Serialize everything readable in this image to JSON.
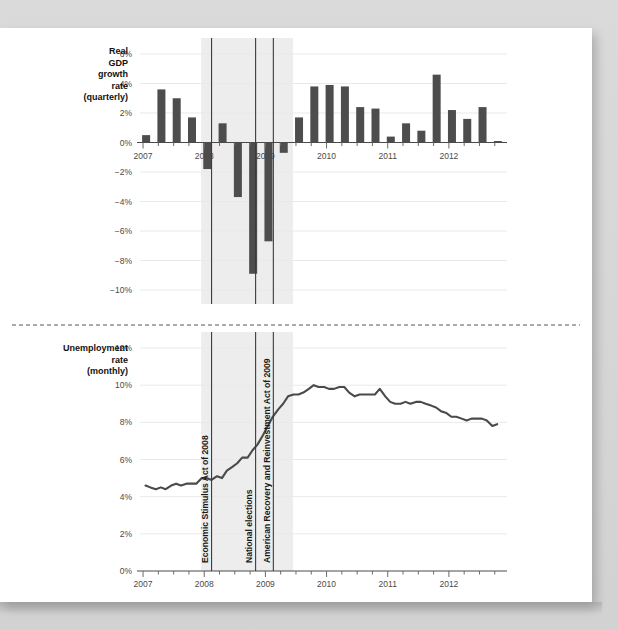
{
  "figure": {
    "background_color": "#d6d6d6",
    "paper_color": "#ffffff",
    "series_color": "#4d4d4d",
    "band_color": "#ededed"
  },
  "panels": {
    "gdp": {
      "side_label_lines": [
        "Real",
        "GDP",
        "growth",
        "rate",
        "(quarterly)"
      ],
      "y_ticks": [
        "6%",
        "4%",
        "2%",
        "0%",
        "−2%",
        "−4%",
        "−6%",
        "−8%",
        "−10%"
      ],
      "x_ticks": [
        "2007",
        "2008",
        "2009",
        "2010",
        "2011",
        "2012"
      ]
    },
    "unemployment": {
      "side_label_lines": [
        "Unemployment",
        "rate",
        "(monthly)"
      ],
      "y_ticks": [
        "12%",
        "10%",
        "8%",
        "6%",
        "4%",
        "2%",
        "0%"
      ],
      "x_ticks": [
        "2007",
        "2008",
        "2009",
        "2010",
        "2011",
        "2012"
      ]
    }
  },
  "annotations": [
    {
      "label": "Economic Stimulus Act of 2008",
      "x_year": 2008.12
    },
    {
      "label": "National elections",
      "x_year": 2008.84
    },
    {
      "label": "American Recovery and Reinvestment Act of 2009",
      "x_year": 2009.13
    }
  ],
  "recession_band": {
    "start_year": 2007.95,
    "end_year": 2009.45
  },
  "chart_data": [
    {
      "type": "bar",
      "title": "Real GDP growth rate (quarterly)",
      "xlabel": "",
      "ylabel": "Real GDP growth rate (quarterly)",
      "ylim": [
        -10,
        6
      ],
      "xlim": [
        2006.95,
        2012.95
      ],
      "grid": true,
      "legend": "none",
      "categories": [
        "2007Q1",
        "2007Q2",
        "2007Q3",
        "2007Q4",
        "2008Q1",
        "2008Q2",
        "2008Q3",
        "2008Q4",
        "2009Q1",
        "2009Q2",
        "2009Q3",
        "2009Q4",
        "2010Q1",
        "2010Q2",
        "2010Q3",
        "2010Q4",
        "2011Q1",
        "2011Q2",
        "2011Q3",
        "2011Q4",
        "2012Q1",
        "2012Q2",
        "2012Q3",
        "2012Q4"
      ],
      "x": [
        2007.05,
        2007.3,
        2007.55,
        2007.8,
        2008.05,
        2008.3,
        2008.55,
        2008.8,
        2009.05,
        2009.3,
        2009.55,
        2009.8,
        2010.05,
        2010.3,
        2010.55,
        2010.8,
        2011.05,
        2011.3,
        2011.55,
        2011.8,
        2012.05,
        2012.3,
        2012.55,
        2012.8
      ],
      "values": [
        0.5,
        3.6,
        3.0,
        1.7,
        -1.8,
        1.3,
        -3.7,
        -8.9,
        -6.7,
        -0.7,
        1.7,
        3.8,
        3.9,
        3.8,
        2.4,
        2.3,
        0.4,
        1.3,
        0.8,
        4.6,
        2.2,
        1.6,
        2.4,
        0.1
      ]
    },
    {
      "type": "line",
      "title": "Unemployment rate (monthly)",
      "xlabel": "",
      "ylabel": "Unemployment rate (monthly)",
      "ylim": [
        0,
        12
      ],
      "xlim": [
        2006.95,
        2012.95
      ],
      "grid": true,
      "legend": "none",
      "x": [
        2007.04,
        2007.12,
        2007.21,
        2007.29,
        2007.37,
        2007.46,
        2007.54,
        2007.62,
        2007.71,
        2007.79,
        2007.87,
        2007.96,
        2008.04,
        2008.12,
        2008.21,
        2008.29,
        2008.37,
        2008.46,
        2008.54,
        2008.62,
        2008.71,
        2008.79,
        2008.87,
        2008.96,
        2009.04,
        2009.12,
        2009.21,
        2009.29,
        2009.37,
        2009.46,
        2009.54,
        2009.62,
        2009.71,
        2009.79,
        2009.87,
        2009.96,
        2010.04,
        2010.12,
        2010.21,
        2010.29,
        2010.37,
        2010.46,
        2010.54,
        2010.62,
        2010.71,
        2010.79,
        2010.87,
        2010.96,
        2011.04,
        2011.12,
        2011.21,
        2011.29,
        2011.37,
        2011.46,
        2011.54,
        2011.62,
        2011.71,
        2011.79,
        2011.87,
        2011.96,
        2012.04,
        2012.12,
        2012.21,
        2012.29,
        2012.37,
        2012.46,
        2012.54,
        2012.62,
        2012.71,
        2012.79
      ],
      "values": [
        4.6,
        4.5,
        4.4,
        4.5,
        4.4,
        4.6,
        4.7,
        4.6,
        4.7,
        4.7,
        4.7,
        5.0,
        5.0,
        4.9,
        5.1,
        5.0,
        5.4,
        5.6,
        5.8,
        6.1,
        6.1,
        6.5,
        6.8,
        7.3,
        7.8,
        8.3,
        8.7,
        9.0,
        9.4,
        9.5,
        9.5,
        9.6,
        9.8,
        10.0,
        9.9,
        9.9,
        9.8,
        9.8,
        9.9,
        9.9,
        9.6,
        9.4,
        9.5,
        9.5,
        9.5,
        9.5,
        9.8,
        9.4,
        9.1,
        9.0,
        9.0,
        9.1,
        9.0,
        9.1,
        9.1,
        9.0,
        8.9,
        8.8,
        8.6,
        8.5,
        8.3,
        8.3,
        8.2,
        8.1,
        8.2,
        8.2,
        8.2,
        8.1,
        7.8,
        7.9
      ]
    }
  ]
}
